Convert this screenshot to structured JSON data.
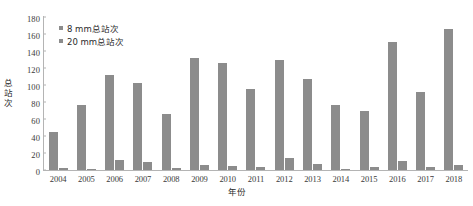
{
  "chart_data": {
    "type": "bar",
    "title": "",
    "subtitle": "",
    "xlabel": "年份",
    "ylabel": "总站次",
    "ylim": [
      0,
      180
    ],
    "ytick_step": 20,
    "yticks": [
      "180",
      "160",
      "140",
      "120",
      "100",
      "80",
      "60",
      "40",
      "20",
      "0"
    ],
    "grid": false,
    "legend_position": "top-left",
    "bar_color": "#8c8c8c",
    "categories": [
      "2004",
      "2005",
      "2006",
      "2007",
      "2008",
      "2009",
      "2010",
      "2011",
      "2012",
      "2013",
      "2014",
      "2015",
      "2016",
      "2017",
      "2018"
    ],
    "series": [
      {
        "name": "8 mm总站次",
        "values": [
          45,
          76,
          112,
          102,
          66,
          132,
          126,
          95,
          129,
          107,
          76,
          69,
          151,
          92,
          166
        ]
      },
      {
        "name": "20 mm总站次",
        "values": [
          2,
          1,
          12,
          9,
          2,
          6,
          5,
          4,
          14,
          7,
          1,
          3,
          11,
          4,
          6
        ]
      }
    ]
  },
  "legend": {
    "items": [
      {
        "label": "8 mm总站次",
        "color": "#8c8c8c"
      },
      {
        "label": "20 mm总站次",
        "color": "#8c8c8c"
      }
    ]
  },
  "axes": {
    "y_title": "总站次",
    "x_title": "年份"
  }
}
